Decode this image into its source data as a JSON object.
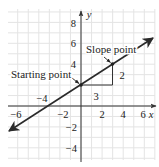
{
  "chart_data": {
    "type": "line",
    "title": "",
    "xlabel": "x",
    "ylabel": "y",
    "xlim": [
      -7,
      7
    ],
    "ylim": [
      -5,
      9
    ],
    "grid": true,
    "grid_step": 1,
    "x_ticks": [
      {
        "value": -6,
        "label": "−6"
      },
      {
        "value": -4,
        "label": "−4"
      },
      {
        "value": -2,
        "label": "−2"
      },
      {
        "value": 2,
        "label": "2"
      },
      {
        "value": 4,
        "label": "4"
      },
      {
        "value": 6,
        "label": "6"
      }
    ],
    "y_ticks": [
      {
        "value": 8,
        "label": "8"
      },
      {
        "value": 6,
        "label": "6"
      },
      {
        "value": 4,
        "label": "4"
      },
      {
        "value": -2,
        "label": "−2"
      },
      {
        "value": -4,
        "label": "−4"
      }
    ],
    "series": [
      {
        "name": "y = (2/3)x + 2",
        "slope": 0.6667,
        "intercept": 2,
        "x": [
          -7,
          7
        ],
        "y": [
          -2.67,
          6.67
        ],
        "arrows_both_ends": true
      }
    ],
    "points": [
      {
        "name": "Starting point",
        "x": 0,
        "y": 2
      },
      {
        "name": "Slope point",
        "x": 3,
        "y": 4
      }
    ],
    "slope_triangle": {
      "run": 3,
      "rise": 2,
      "run_label": "3",
      "rise_label": "2"
    },
    "annotations": [
      {
        "text": "Starting point",
        "target": [
          0,
          2
        ]
      },
      {
        "text": "Slope point",
        "target": [
          3,
          4
        ]
      }
    ]
  },
  "labels": {
    "starting_point": "Starting point",
    "slope_point": "Slope point",
    "run": "3",
    "rise": "2",
    "x_axis": "x",
    "y_axis": "y",
    "xt_m6": "−6",
    "xt_m4": "−4",
    "xt_m2": "−2",
    "xt_2": "2",
    "xt_4": "4",
    "xt_6": "6",
    "yt_8": "8",
    "yt_6": "6",
    "yt_4": "4",
    "yt_m2": "−2",
    "yt_m4": "−4"
  },
  "colors": {
    "grid": "#e4e4e4",
    "axis": "#333333",
    "line": "#2a2a2a",
    "text": "#222222"
  }
}
